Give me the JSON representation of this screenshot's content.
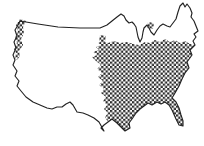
{
  "figure": {
    "type": "map",
    "background_color": "#ffffff",
    "line_color": "#222222",
    "hatch_color": "#2a2a2a",
    "regions": [
      {
        "id": "eastern-us",
        "label": "Large cross-hatched region covering the eastern United States",
        "pattern": "checker-crosshatch"
      },
      {
        "id": "pacific-northwest-strip",
        "label": "Narrow cross-hatched strip along the Pacific Northwest coast",
        "pattern": "checker-crosshatch"
      },
      {
        "id": "fragment-upper-midwest",
        "label": "Small detached cross-hatched fragment in the upper Midwest",
        "pattern": "checker-crosshatch"
      },
      {
        "id": "fragment-great-lakes",
        "label": "Small detached cross-hatched fragment near the Great Lakes",
        "pattern": "checker-crosshatch"
      }
    ],
    "paths": {
      "us_outline": "M 20,21 L 38,24 L 58,27 L 80,28 L 100,28 L 107,25 L 112,21 L 117,17 L 121,14 L 124,16 L 126,20 L 129,23 L 132,22 L 134,24 L 136,27 L 137,32 L 138,37 L 140,42 L 142,38 L 143,32 L 144,28 L 147,25 L 149,28 L 151,32 L 154,35 L 157,30 L 160,26 L 163,24 L 167,26 L 170,27 L 173,23 L 176,19 L 178,12 L 180,6 L 183,3 L 185,7 L 187,4 L 190,8 L 192,13 L 191,17 L 194,21 L 196,26 L 198,31 L 194,34 L 196,37 L 193,41 L 195,45 L 190,50 L 192,55 L 187,62 L 189,68 L 185,73 L 182,79 L 179,86 L 175,93 L 172,98 L 176,102 L 179,108 L 181,115 L 183,121 L 183,126 L 179,125 L 176,119 L 172,110 L 169,105 L 165,102 L 161,104 L 157,102 L 152,105 L 148,103 L 144,106 L 140,109 L 136,113 L 132,119 L 129,123 L 130,128 L 125,131 L 121,127 L 117,123 L 112,119 L 108,122 L 104,125 L 101,128 L 104,131 L 99,122 L 94,118 L 88,115 L 83,113 L 77,112 L 73,105 L 70,102 L 66,104 L 62,107 L 57,107 L 52,109 L 47,108 L 40,105 L 33,102 L 26,97 L 21,91 L 17,86 L 19,81 L 15,76 L 17,71 L 13,65 L 15,60 L 13,55 L 16,48 L 14,42 L 17,36 L 15,30 L 18,25 Z",
      "eastern_region": "M 102,41 L 108,43 L 114,41 L 120,43 L 127,42 L 133,44 L 139,45 L 145,42 L 150,43 L 155,40 L 160,42 L 165,39 L 170,42 L 175,40 L 180,43 L 185,41 L 190,44 L 195,45 L 190,50 L 192,55 L 187,62 L 189,68 L 185,73 L 182,79 L 179,86 L 175,93 L 172,98 L 176,102 L 179,108 L 181,115 L 183,121 L 183,126 L 179,125 L 176,119 L 172,110 L 169,105 L 165,102 L 161,104 L 157,102 L 152,105 L 148,103 L 144,106 L 140,109 L 136,113 L 132,119 L 129,123 L 130,128 L 125,131 L 121,127 L 117,123 L 112,119 L 108,122 L 105,117 L 108,113 L 104,109 L 107,105 L 103,101 L 106,97 L 101,93 L 104,89 L 99,85 L 103,81 L 98,77 L 102,73 L 97,69 L 101,65 L 96,61 L 92,57 L 97,55 L 93,52 L 99,50 L 96,47 L 101,45 L 98,43 Z",
      "west_coast_strip": "M 20,19 L 26,21 L 23,27 L 24,33 L 21,39 L 23,45 L 19,51 L 20,56 L 17,60 L 15,58 L 16,53 L 14,49 L 17,43 L 15,37 L 18,31 L 16,25 Z",
      "fragment_upper_midwest": "M 100,35 L 106,36 L 105,42 L 99,41 Z",
      "fragment_great_lakes": "M 148,22 L 154,23 L 153,29 L 147,28 Z"
    }
  }
}
